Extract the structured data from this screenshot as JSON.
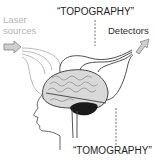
{
  "diagram": {
    "labels": {
      "laser_line1": "Laser",
      "laser_line2": "sources",
      "topography": "“TOPOGRAPHY”",
      "detectors": "Detectors",
      "tomography": "“TOMOGRAPHY”"
    },
    "icons": {
      "source_arrow": "arrow-right-icon",
      "detector_arrow": "arrow-up-right-icon",
      "brain": "brain-illustration",
      "head": "head-profile-outline"
    },
    "colors": {
      "laser_text": "#b4b4b4",
      "text": "#1e1e1e",
      "source_paths": "#b0b0b0",
      "detector_paths": "#3a3a3a",
      "brain_fill": "#d8d8d8",
      "cerebellum": "#1a1a1a",
      "dashed_line": "#707070"
    }
  }
}
